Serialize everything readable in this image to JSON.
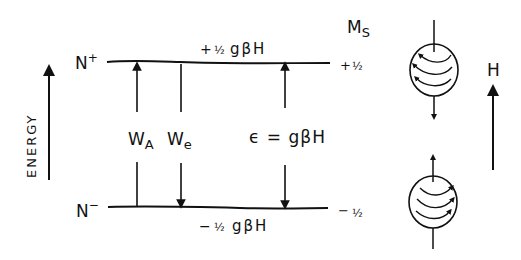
{
  "diagram": {
    "energy_axis": {
      "label": "ENERGY"
    },
    "levels": {
      "upper": {
        "population_label": "N",
        "population_sup": "+",
        "energy_sign": "+",
        "energy_frac": "½",
        "energy_expr": "gβH",
        "ms_sign": "+",
        "ms_frac": "½"
      },
      "lower": {
        "population_label": "N",
        "population_sup": "−",
        "energy_sign": "−",
        "energy_frac": "½",
        "energy_expr": "gβH",
        "ms_sign": "−",
        "ms_frac": "½"
      }
    },
    "ms_header": {
      "main": "M",
      "sub": "S"
    },
    "transitions": {
      "absorption": {
        "main": "W",
        "sub": "A"
      },
      "emission": {
        "main": "W",
        "sub": "e"
      },
      "gap": {
        "label": "ϵ = gβH"
      }
    },
    "field": {
      "label": "H"
    }
  }
}
